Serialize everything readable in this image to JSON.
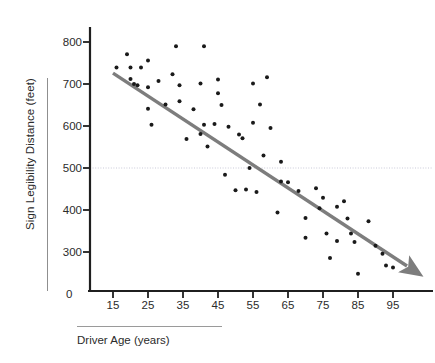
{
  "chart_data": {
    "type": "scatter",
    "title": "",
    "xlabel": "Driver Age (years)",
    "ylabel": "Sign Legibility Distance (feet)",
    "xlim": [
      10,
      102
    ],
    "ylim": [
      230,
      830
    ],
    "xticks": [
      15,
      25,
      35,
      45,
      55,
      65,
      75,
      85,
      95
    ],
    "yticks": [
      300,
      400,
      500,
      600,
      700,
      800
    ],
    "origin_label": "0",
    "grid": "single horizontal dotted reference line at y = 500",
    "gridline_value": 500,
    "legend": "none",
    "marker_color": "#1a1a1a",
    "trendline_color": "#7d7d7d",
    "series": [
      {
        "name": "Drivers",
        "points": [
          [
            16,
            739
          ],
          [
            19,
            771
          ],
          [
            20,
            712
          ],
          [
            20,
            739
          ],
          [
            21,
            700
          ],
          [
            22,
            697
          ],
          [
            23,
            739
          ],
          [
            25,
            692
          ],
          [
            25,
            756
          ],
          [
            25,
            641
          ],
          [
            26,
            603
          ],
          [
            28,
            707
          ],
          [
            30,
            651
          ],
          [
            32,
            723
          ],
          [
            33,
            790
          ],
          [
            34,
            697
          ],
          [
            34,
            659
          ],
          [
            36,
            569
          ],
          [
            38,
            640
          ],
          [
            40,
            701
          ],
          [
            40,
            581
          ],
          [
            41,
            603
          ],
          [
            41,
            790
          ],
          [
            42,
            551
          ],
          [
            44,
            605
          ],
          [
            45,
            711
          ],
          [
            45,
            678
          ],
          [
            46,
            650
          ],
          [
            47,
            484
          ],
          [
            48,
            598
          ],
          [
            50,
            447
          ],
          [
            51,
            580
          ],
          [
            52,
            571
          ],
          [
            53,
            449
          ],
          [
            54,
            500
          ],
          [
            55,
            608
          ],
          [
            55,
            701
          ],
          [
            56,
            443
          ],
          [
            57,
            651
          ],
          [
            58,
            530
          ],
          [
            59,
            716
          ],
          [
            60,
            595
          ],
          [
            62,
            394
          ],
          [
            63,
            515
          ],
          [
            63,
            468
          ],
          [
            65,
            466
          ],
          [
            68,
            445
          ],
          [
            70,
            334
          ],
          [
            70,
            381
          ],
          [
            73,
            452
          ],
          [
            74,
            404
          ],
          [
            75,
            429
          ],
          [
            76,
            344
          ],
          [
            77,
            286
          ],
          [
            79,
            408
          ],
          [
            79,
            326
          ],
          [
            81,
            421
          ],
          [
            82,
            380
          ],
          [
            83,
            344
          ],
          [
            84,
            324
          ],
          [
            85,
            248
          ],
          [
            88,
            373
          ],
          [
            90,
            315
          ],
          [
            92,
            296
          ],
          [
            93,
            268
          ],
          [
            95,
            263
          ]
        ]
      }
    ],
    "trendline": {
      "name": "fitted trend (arrow)",
      "start": [
        15,
        726
      ],
      "end": [
        101,
        258
      ],
      "has_arrowhead": true
    }
  },
  "axis": {
    "y_title": "Sign Legibility Distance (feet)",
    "x_title": "Driver Age (years)",
    "y_ticks": [
      "800",
      "700",
      "600",
      "500",
      "400",
      "300"
    ],
    "x_ticks": [
      "15",
      "25",
      "35",
      "45",
      "55",
      "65",
      "75",
      "85",
      "95"
    ],
    "origin": "0"
  },
  "colors": {
    "marker": "#1a1a1a",
    "trendline": "#7d7d7d",
    "axis": "#1f1f1f",
    "gridline": "#c9c9d8",
    "rule": "#8f8f8f",
    "text": "#2b2b2b"
  }
}
